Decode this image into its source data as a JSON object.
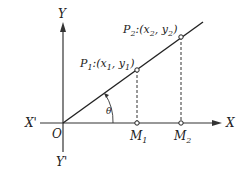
{
  "diagram": {
    "axes": {
      "x_positive": "X",
      "x_negative": "X'",
      "y_positive": "Y",
      "y_negative": "Y'",
      "origin": "O"
    },
    "points": [
      {
        "name": "P",
        "sub": "1",
        "coords_prefix": ":(",
        "x": "x",
        "xsub": "1",
        "y": "y",
        "ysub": "1"
      },
      {
        "name": "P",
        "sub": "2",
        "coords_prefix": ":(",
        "x": "x",
        "xsub": "2",
        "y": "y",
        "ysub": "2"
      }
    ],
    "feet": [
      {
        "name": "M",
        "sub": "1"
      },
      {
        "name": "M",
        "sub": "2"
      }
    ],
    "angle": "θ",
    "colors": {
      "ink": "#222222",
      "background": "#ffffff"
    }
  }
}
